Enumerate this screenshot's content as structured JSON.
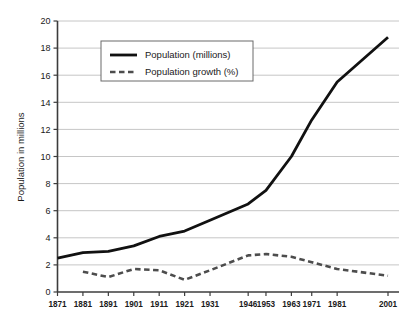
{
  "chart_data": {
    "type": "line",
    "title": "",
    "subtitle": "",
    "xlabel": "",
    "ylabel": "Population in millions",
    "ylim": [
      0,
      20
    ],
    "xlim": [
      1871,
      2001
    ],
    "yticks": [
      0,
      2,
      4,
      6,
      8,
      10,
      12,
      14,
      16,
      18,
      20
    ],
    "ytick_labels": [
      "0",
      "2",
      "4",
      "6",
      "8",
      "10",
      "12",
      "14",
      "16",
      "18",
      "20"
    ],
    "grid": "horizontal",
    "legend_position": "upper-left-inside",
    "x": [
      1871,
      1881,
      1891,
      1901,
      1911,
      1921,
      1931,
      1946,
      1953,
      1963,
      1971,
      1981,
      2001
    ],
    "categories": [
      "1871",
      "1881",
      "1891",
      "1901",
      "1911",
      "1921",
      "1931",
      "1946",
      "1953",
      "1963",
      "1971",
      "1981",
      "2001"
    ],
    "series": [
      {
        "name": "Population (millions)",
        "style": "solid",
        "color": "#111111",
        "values": [
          2.5,
          2.9,
          3.0,
          3.4,
          4.1,
          4.5,
          5.3,
          6.5,
          7.5,
          10.0,
          12.7,
          15.5,
          18.8
        ]
      },
      {
        "name": "Population growth (%)",
        "style": "dashed",
        "color": "#4d4d4d",
        "values": [
          null,
          1.5,
          1.1,
          1.7,
          1.6,
          0.9,
          1.6,
          2.7,
          2.8,
          2.6,
          2.2,
          1.7,
          1.2
        ]
      }
    ]
  },
  "axes": {
    "y_title": "Population in millions",
    "y_ticks": [
      "0",
      "2",
      "4",
      "6",
      "8",
      "10",
      "12",
      "14",
      "16",
      "18",
      "20"
    ],
    "x_ticks": [
      "1871",
      "1881",
      "1891",
      "1901",
      "1911",
      "1921",
      "1931",
      "1946",
      "1953",
      "1963",
      "1971",
      "1981",
      "2001"
    ]
  },
  "legend": {
    "items": [
      {
        "label": "Population (millions)",
        "style": "solid",
        "color": "#111111"
      },
      {
        "label": "Population growth (%)",
        "style": "dashed",
        "color": "#4d4d4d"
      }
    ]
  },
  "colors": {
    "background": "#ffffff",
    "axis": "#3c3c3c",
    "grid": "#c6c6c6",
    "population_line": "#111111",
    "growth_line": "#4d4d4d",
    "text": "#1a1a1a",
    "legend_border": "#6a6a6a"
  }
}
